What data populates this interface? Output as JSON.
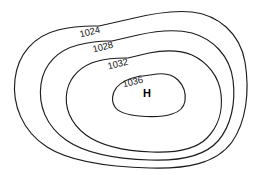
{
  "figure": {
    "background_color": "#ffffff",
    "line_color": "#1c1c1c",
    "label_color": "#111111",
    "width": 256,
    "height": 175
  },
  "chart_data": {
    "type": "contour",
    "title": "",
    "xlabel": "",
    "ylabel": "",
    "units": "millibars",
    "contour_interval": 4,
    "grid": false,
    "legend": "none",
    "center_marker": {
      "label": "H",
      "meaning": "high-pressure-center",
      "x": 147,
      "y": 93
    },
    "contours": [
      {
        "value": "1024",
        "label": "1024",
        "label_x": 100,
        "label_y": 30,
        "label_rotation": -14,
        "level_index": 0,
        "path": "M 99 26 L 130 19 C 150 14 172 10 192 12 C 218 15 240 33 245 62 C 250 92 246 122 232 142 C 216 164 186 169 150 168 C 112 167 72 163 47 147 C 22 131 12 104 15 79 C 18 54 34 36 58 30 C 70 27 85 26 94 26 Z"
      },
      {
        "value": "1028",
        "label": "1028",
        "label_x": 113,
        "label_y": 45,
        "label_rotation": -14,
        "level_index": 1,
        "path": "M 112 41 L 138 35 C 156 31 176 29 192 33 C 213 39 230 56 233 80 C 236 103 231 126 218 141 C 204 157 178 161 150 160 C 118 159 86 154 66 140 C 46 126 38 105 41 84 C 44 64 58 50 78 45 C 90 42 104 41 109 41 Z"
      },
      {
        "value": "1032",
        "label": "1032",
        "label_x": 128,
        "label_y": 62,
        "label_rotation": -14,
        "level_index": 2,
        "path": "M 128 58 L 149 53 C 164 50 180 50 192 55 C 207 62 219 76 221 94 C 223 111 218 127 207 138 C 195 150 175 153 152 152 C 126 151 101 146 86 135 C 70 123 64 107 67 91 C 70 76 82 65 98 61 C 108 58 122 58 126 58 Z"
      },
      {
        "value": "1036",
        "label": "1036",
        "label_x": 143,
        "label_y": 80,
        "label_rotation": -14,
        "level_index": 3,
        "path": "M 143 76 L 157 74 C 166 73 173 75 178 80 C 184 86 186 94 185 101 C 184 107 179 112 172 114 C 163 117 150 117 139 116 C 128 115 119 113 115 107 C 111 101 112 93 117 87 C 122 81 131 78 140 76 Z"
      }
    ]
  }
}
